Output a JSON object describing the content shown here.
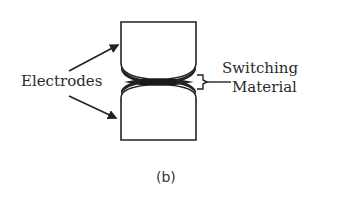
{
  "diagram": {
    "labels": {
      "electrodes": "Electrodes",
      "switching_line1": "Switching",
      "switching_line2": "Material"
    },
    "caption": "(b)",
    "colors": {
      "stroke": "#222222",
      "background": "#ffffff"
    }
  }
}
